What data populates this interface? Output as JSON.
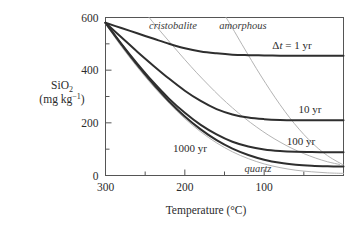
{
  "chart_data": {
    "type": "line",
    "title": "",
    "xlabel": "Temperature (°C)",
    "ylabel_line1": "SiO2",
    "ylabel_line2": "(mg kg-1)",
    "xlim": [
      300,
      0
    ],
    "ylim": [
      0,
      600
    ],
    "x_reversed": true,
    "grid": false,
    "legend_position": "inline-right-annotations",
    "x_ticks_major": [
      300,
      200,
      100
    ],
    "x_ticks_major_labels": [
      "300",
      "200",
      "100"
    ],
    "x_ticks_minor": [
      250,
      150,
      50
    ],
    "y_ticks_major": [
      0,
      200,
      400,
      600
    ],
    "y_ticks_major_labels": [
      "0",
      "200",
      "400",
      "600"
    ],
    "y_ticks_minor": [
      100,
      300,
      500
    ],
    "series": [
      {
        "name": "dt = 1 yr",
        "label": "Δt = 1 yr",
        "style": "thick-dark",
        "x": [
          300,
          280,
          260,
          240,
          220,
          200,
          180,
          160,
          140,
          120,
          100,
          80,
          60,
          40,
          20,
          0
        ],
        "values": [
          580,
          560,
          540,
          520,
          500,
          483,
          471,
          464,
          459,
          457,
          456,
          455,
          455,
          455,
          455,
          455
        ]
      },
      {
        "name": "dt = 10 yr",
        "label": "10 yr",
        "style": "thick-dark",
        "x": [
          300,
          280,
          260,
          240,
          220,
          200,
          180,
          160,
          140,
          120,
          100,
          80,
          60,
          40,
          20,
          0
        ],
        "values": [
          580,
          525,
          470,
          418,
          368,
          322,
          283,
          252,
          232,
          220,
          214,
          211,
          210,
          210,
          210,
          210
        ]
      },
      {
        "name": "dt = 100 yr",
        "label": "100 yr",
        "style": "thick-dark",
        "x": [
          300,
          280,
          260,
          240,
          220,
          200,
          180,
          160,
          140,
          120,
          100,
          80,
          60,
          40,
          20,
          0
        ],
        "values": [
          580,
          500,
          425,
          355,
          292,
          238,
          192,
          156,
          128,
          110,
          99,
          93,
          90,
          89,
          88,
          88
        ]
      },
      {
        "name": "dt = 1000 yr",
        "label": "1000 yr",
        "style": "thick-dark",
        "x": [
          300,
          280,
          260,
          240,
          220,
          200,
          180,
          160,
          140,
          120,
          100,
          80,
          60,
          40,
          20,
          0
        ],
        "values": [
          580,
          498,
          420,
          348,
          282,
          224,
          175,
          134,
          102,
          78,
          60,
          48,
          41,
          37,
          35,
          34
        ]
      },
      {
        "name": "cristobalite solubility",
        "label": "cristobalite",
        "style": "thin-gray",
        "x": [
          245,
          230,
          215,
          200,
          185,
          170,
          155,
          140,
          125,
          110,
          95,
          80,
          65,
          50,
          35,
          20,
          5
        ],
        "values": [
          600,
          545,
          492,
          440,
          390,
          343,
          298,
          257,
          219,
          185,
          154,
          127,
          103,
          83,
          66,
          52,
          42
        ]
      },
      {
        "name": "amorphous silica solubility",
        "label": "amorphous",
        "style": "thin-gray",
        "x": [
          148,
          140,
          128,
          116,
          104,
          92,
          80,
          68,
          56,
          44,
          32,
          20,
          8,
          0
        ],
        "values": [
          600,
          560,
          498,
          437,
          378,
          322,
          269,
          220,
          176,
          137,
          103,
          75,
          53,
          40
        ]
      },
      {
        "name": "quartz solubility",
        "label": "quartz",
        "style": "thin-gray",
        "x": [
          300,
          280,
          260,
          240,
          220,
          200,
          180,
          160,
          140,
          120,
          100,
          80,
          60,
          40,
          20,
          0
        ],
        "values": [
          575,
          490,
          412,
          340,
          275,
          216,
          166,
          124,
          90,
          64,
          44,
          30,
          20,
          14,
          10,
          8
        ]
      }
    ],
    "annotations": [
      {
        "text": "cristobalite",
        "style": "italic",
        "x_px": 173,
        "y_px": 29
      },
      {
        "text": "amorphous",
        "style": "italic",
        "x_px": 243,
        "y_px": 29
      },
      {
        "text": "Δt = 1 yr",
        "style": "roman-italic-t",
        "x_px": 292,
        "y_px": 49
      },
      {
        "text": "10 yr",
        "style": "roman",
        "x_px": 310,
        "y_px": 113
      },
      {
        "text": "100 yr",
        "style": "roman",
        "x_px": 301,
        "y_px": 145
      },
      {
        "text": "1000 yr",
        "style": "roman",
        "x_px": 190,
        "y_px": 152
      },
      {
        "text": "quartz",
        "style": "italic",
        "x_px": 258,
        "y_px": 172
      }
    ],
    "colors": {
      "kinetic_curve": "#2e2e2e",
      "solubility_curve": "#b4b4b4",
      "axis": "#555555",
      "text": "#2b2b2b",
      "background": "#ffffff"
    }
  }
}
